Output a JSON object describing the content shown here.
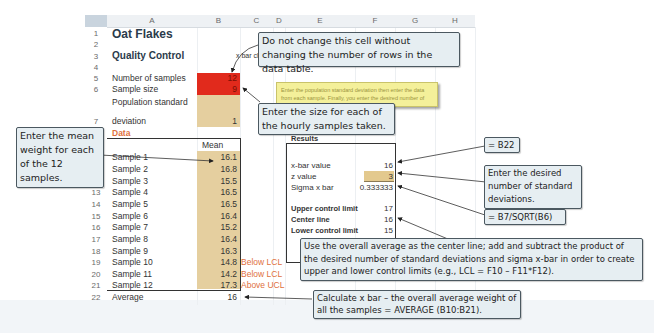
{
  "spreadsheet": {
    "columns": [
      "A",
      "B",
      "C",
      "D",
      "E",
      "F",
      "G",
      "H"
    ],
    "rows": [
      "1",
      "2",
      "3",
      "4",
      "5",
      "6",
      "7",
      "8",
      "9",
      "10",
      "11",
      "12",
      "13",
      "14",
      "15",
      "16",
      "17",
      "18",
      "19",
      "20",
      "21",
      "22"
    ],
    "title": "Oat Flakes",
    "subtitle": "Quality Control",
    "chart_label": "x bar chart",
    "inputs": {
      "num_samples_label": "Number of samples",
      "num_samples_value": "12",
      "sample_size_label": "Sample size",
      "sample_size_value": "9",
      "pop_sd_label_1": "Population standard",
      "pop_sd_label_2": "deviation",
      "pop_sd_value": "1"
    },
    "data_label": "Data",
    "mean_header": "Mean",
    "samples": [
      {
        "label": "Sample 1",
        "mean": "16.1",
        "flag": ""
      },
      {
        "label": "Sample 2",
        "mean": "16.8",
        "flag": ""
      },
      {
        "label": "Sample 3",
        "mean": "15.5",
        "flag": ""
      },
      {
        "label": "Sample 4",
        "mean": "16.5",
        "flag": ""
      },
      {
        "label": "Sample 5",
        "mean": "16.5",
        "flag": ""
      },
      {
        "label": "Sample 6",
        "mean": "16.4",
        "flag": ""
      },
      {
        "label": "Sample 7",
        "mean": "15.2",
        "flag": ""
      },
      {
        "label": "Sample 8",
        "mean": "16.4",
        "flag": ""
      },
      {
        "label": "Sample 9",
        "mean": "16.3",
        "flag": ""
      },
      {
        "label": "Sample 10",
        "mean": "14.8",
        "flag": "Below LCL"
      },
      {
        "label": "Sample 11",
        "mean": "14.2",
        "flag": "Below LCL"
      },
      {
        "label": "Sample 12",
        "mean": "17.3",
        "flag": "Above UCL"
      }
    ],
    "average_label": "Average",
    "average_value": "16",
    "results": {
      "header": "Results",
      "xbar_label": "x-bar value",
      "xbar_value": "16",
      "z_label": "z value",
      "z_value": "3",
      "sigma_label": "Sigma x bar",
      "sigma_value": "0.333333",
      "ucl_label": "Upper control limit",
      "ucl_value": "17",
      "center_label": "Center line",
      "center_value": "16",
      "lcl_label": "Lower control limit",
      "lcl_value": "15"
    },
    "note_text": "Enter the population standard deviation then enter the data from each sample. Finally, you enter the desired number of standard deviations."
  },
  "callouts": {
    "rows_warning": "Do not change this cell without changing the number of rows in the data table.",
    "sample_size": "Enter the size for each of the hourly samples taken.",
    "mean_weight": "Enter the mean weight for each of the 12 samples.",
    "b22": "= B22",
    "std_devs": "Enter the desired number of standard deviations.",
    "sqrt": "= B7/SQRT(B6)",
    "control_limits": "Use the overall average as the center line; add and subtract the product of the desired number of standard deviations and sigma x-bar in order to create upper and lower control limits (e.g., LCL = F10 – F11*F12).",
    "average": "Calculate x bar – the overall average weight of all the samples = AVERAGE (B10:B21)."
  },
  "colors": {
    "red_input": "#e12a1c",
    "tan_input": "#e3c98e",
    "flag_orange": "#e0703d",
    "callout_bg": "#e6eef2",
    "note_yellow": "#f4f09a"
  }
}
